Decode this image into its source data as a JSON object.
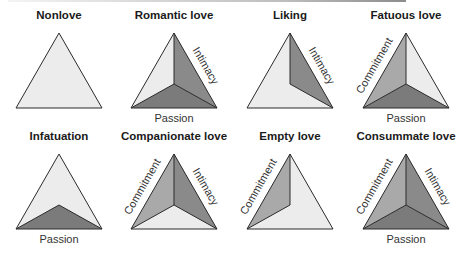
{
  "figure": {
    "colors": {
      "empty_face": "#ececec",
      "commitment_face": "#a9a9a9",
      "intimacy_face": "#8a8a8a",
      "passion_face": "#7b7b7b",
      "edge": "#2b2b2b",
      "label_text": "#333333"
    },
    "components": {
      "intimacy": "Intimacy",
      "passion": "Passion",
      "commitment": "Commitment"
    },
    "panels": [
      {
        "id": "nonlove",
        "title": "Nonlove",
        "intimacy": false,
        "passion": false,
        "commitment": false
      },
      {
        "id": "romantic-love",
        "title": "Romantic love",
        "intimacy": true,
        "passion": true,
        "commitment": false
      },
      {
        "id": "liking",
        "title": "Liking",
        "intimacy": true,
        "passion": false,
        "commitment": false
      },
      {
        "id": "fatuous-love",
        "title": "Fatuous love",
        "intimacy": false,
        "passion": true,
        "commitment": true
      },
      {
        "id": "infatuation",
        "title": "Infatuation",
        "intimacy": false,
        "passion": true,
        "commitment": false
      },
      {
        "id": "companionate-love",
        "title": "Companionate love",
        "intimacy": true,
        "passion": false,
        "commitment": true
      },
      {
        "id": "empty-love",
        "title": "Empty love",
        "intimacy": false,
        "passion": false,
        "commitment": true
      },
      {
        "id": "consummate-love",
        "title": "Consummate love",
        "intimacy": true,
        "passion": true,
        "commitment": true
      }
    ]
  }
}
